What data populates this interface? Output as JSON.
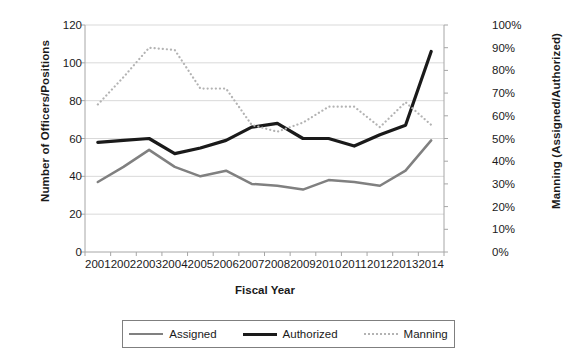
{
  "chart_data": {
    "type": "line",
    "title": "",
    "xlabel": "Fiscal Year",
    "ylabel": "Number of Officers/Positions",
    "y2label": "Manning (Assigned/Authorized)",
    "categories": [
      "2001",
      "2002",
      "2003",
      "2004",
      "2005",
      "2006",
      "2007",
      "2008",
      "2009",
      "2010",
      "2011",
      "2012",
      "2013",
      "2014"
    ],
    "ylim": [
      0,
      120
    ],
    "yticks": [
      "0",
      "20",
      "40",
      "60",
      "80",
      "100",
      "120"
    ],
    "y2lim": [
      0,
      100
    ],
    "y2ticks": [
      "0%",
      "10%",
      "20%",
      "30%",
      "40%",
      "50%",
      "60%",
      "70%",
      "80%",
      "90%",
      "100%"
    ],
    "grid": true,
    "legend_position": "bottom",
    "series": [
      {
        "name": "Assigned",
        "axis": "left",
        "color": "#808080",
        "style": "solid",
        "values": [
          37,
          45,
          54,
          45,
          40,
          43,
          36,
          35,
          33,
          38,
          37,
          35,
          43,
          59
        ]
      },
      {
        "name": "Authorized",
        "axis": "left",
        "color": "#1a1a1a",
        "style": "solid",
        "values": [
          58,
          59,
          60,
          52,
          55,
          59,
          66,
          68,
          60,
          60,
          56,
          62,
          67,
          106
        ]
      },
      {
        "name": "Manning",
        "axis": "right",
        "color": "#b3b3b3",
        "style": "dotted",
        "values": [
          65,
          77,
          90,
          89,
          72,
          72,
          56,
          53,
          57,
          64,
          64,
          55,
          66,
          56
        ]
      }
    ]
  },
  "legend": {
    "items": [
      {
        "label": "Assigned"
      },
      {
        "label": "Authorized"
      },
      {
        "label": "Manning"
      }
    ]
  }
}
